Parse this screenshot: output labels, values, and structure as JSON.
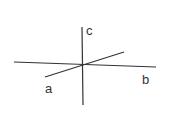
{
  "diagram": {
    "line_color": "#333333",
    "lines": [
      {
        "id": "b",
        "x1": 14,
        "y1": 62,
        "x2": 156,
        "y2": 67
      },
      {
        "id": "a",
        "x1": 45,
        "y1": 77,
        "x2": 124,
        "y2": 52
      },
      {
        "id": "c",
        "x1": 82,
        "y1": 27,
        "x2": 83,
        "y2": 105
      }
    ],
    "labels": {
      "a": "a",
      "b": "b",
      "c": "c"
    }
  }
}
